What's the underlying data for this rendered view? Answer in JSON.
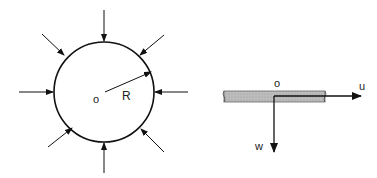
{
  "left_figure": {
    "center_label": "o",
    "radius_label": "R",
    "description": "Circular ring under uniform external radial pressure",
    "pressure_arrow_count": 8
  },
  "right_figure": {
    "origin_label": "o",
    "axis_u_label": "u",
    "axis_w_label": "w",
    "description": "Cross-section of ring wall with displacement axes u (horizontal) and w (downward)"
  },
  "colors": {
    "line": "#111111",
    "beam_fill": "#b8b8b8"
  }
}
